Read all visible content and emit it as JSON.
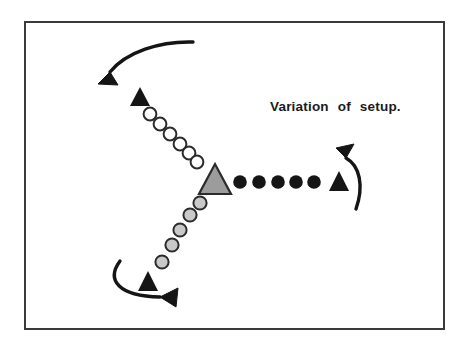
{
  "figure": {
    "caption": "Variation of setup.",
    "background_color": "#ffffff",
    "frame": {
      "name": "diagram-border",
      "stroke_color": "#3a3a3a",
      "x": 24,
      "y": 21,
      "width": 421,
      "height": 309,
      "stroke_width": 2
    },
    "caption_position": {
      "x": 270,
      "y": 111
    },
    "colors": {
      "ink": "#151515",
      "gray_fill": "#9c9c9c",
      "light_gray_fill": "#c9c9c9",
      "outline": "#2b2b2b",
      "open_fill": "#ffffff"
    },
    "elements": {
      "center_marker": {
        "name": "gray-triangle-center",
        "shape": "triangle",
        "fill": "#9c9c9c",
        "stroke": "#2b2b2b",
        "cx": 215,
        "base_y": 194,
        "apex_y": 164,
        "half_width": 16
      },
      "black_triangles": [
        {
          "name": "black-triangle-upper-left",
          "cx": 140,
          "base_y": 106,
          "apex_y": 87,
          "half_width": 10
        },
        {
          "name": "black-triangle-right",
          "cx": 339,
          "base_y": 191,
          "apex_y": 171,
          "half_width": 10
        },
        {
          "name": "black-triangle-bottom-left",
          "cx": 148,
          "base_y": 291,
          "apex_y": 271,
          "half_width": 10
        }
      ],
      "open_circles": {
        "name": "open-circle-path",
        "count": 6,
        "radius": 6.4,
        "fill": "#ffffff",
        "stroke": "#2b2b2b",
        "points": [
          {
            "cx": 150,
            "cy": 114
          },
          {
            "cx": 160,
            "cy": 124
          },
          {
            "cx": 170,
            "cy": 134
          },
          {
            "cx": 180,
            "cy": 144
          },
          {
            "cx": 189,
            "cy": 153
          },
          {
            "cx": 197,
            "cy": 162
          }
        ]
      },
      "gray_circles": {
        "name": "gray-circle-path",
        "count": 5,
        "radius": 6.6,
        "fill": "#c9c9c9",
        "stroke": "#2b2b2b",
        "points": [
          {
            "cx": 200,
            "cy": 203
          },
          {
            "cx": 190,
            "cy": 215
          },
          {
            "cx": 180,
            "cy": 230
          },
          {
            "cx": 172,
            "cy": 245
          },
          {
            "cx": 162,
            "cy": 262
          }
        ]
      },
      "black_circles": {
        "name": "black-circle-path",
        "count": 5,
        "radius": 6.8,
        "fill": "#151515",
        "points": [
          {
            "cx": 240,
            "cy": 182
          },
          {
            "cx": 259,
            "cy": 182
          },
          {
            "cx": 278,
            "cy": 182
          },
          {
            "cx": 296,
            "cy": 182
          },
          {
            "cx": 314,
            "cy": 182
          }
        ]
      },
      "arrows": [
        {
          "name": "curved-arrow-top-left",
          "direction": "down-left",
          "path": "M 193 42 C 160 41 126 52 110 72",
          "head": "M 110 72 L 98 84 L 118 85 Z"
        },
        {
          "name": "curved-arrow-bottom-left",
          "direction": "right",
          "path": "M 120 261 C 106 280 118 296 160 297",
          "head": "M 160 297 L 178 288 L 176 307 Z"
        },
        {
          "name": "curved-arrow-right",
          "direction": "up",
          "path": "M 356 209 C 364 186 360 166 346 158",
          "head": "M 346 158 L 336 148 L 354 144 Z"
        }
      ]
    }
  }
}
